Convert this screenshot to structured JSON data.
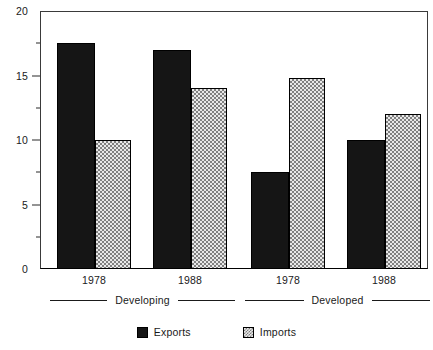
{
  "chart_data": {
    "type": "bar",
    "title": "",
    "subtitle": "",
    "xlabel": "",
    "ylabel": "",
    "ylim": [
      0,
      20
    ],
    "y_major_ticks": [
      0,
      5,
      10,
      15,
      20
    ],
    "y_major_tick_labels": [
      "0",
      "5",
      "10",
      "15",
      "20"
    ],
    "y_minor_ticks": [
      2.5,
      7.5,
      12.5,
      17.5
    ],
    "grid": false,
    "legend_position": "bottom-center",
    "groups": [
      {
        "group": "Developing",
        "year": "1978"
      },
      {
        "group": "Developing",
        "year": "1988"
      },
      {
        "group": "Developed",
        "year": "1978"
      },
      {
        "group": "Developed",
        "year": "1988"
      }
    ],
    "categories": [
      "1978",
      "1988",
      "1978",
      "1988"
    ],
    "group_brackets": [
      {
        "label": "Developing",
        "categories": [
          "1978",
          "1988"
        ]
      },
      {
        "label": "Developed",
        "categories": [
          "1978",
          "1988"
        ]
      }
    ],
    "series": [
      {
        "name": "Exports",
        "fill": "solid-black",
        "color": "#151515",
        "values": [
          17.5,
          17.0,
          7.5,
          10.0
        ]
      },
      {
        "name": "Imports",
        "fill": "checkerboard-gray",
        "color": "#c0c0c0",
        "values": [
          10.0,
          14.0,
          14.8,
          12.0
        ]
      }
    ],
    "bars": [
      {
        "group": "Developing",
        "year": "1978",
        "series": "Exports",
        "value": 17.5
      },
      {
        "group": "Developing",
        "year": "1978",
        "series": "Imports",
        "value": 10.0
      },
      {
        "group": "Developing",
        "year": "1988",
        "series": "Exports",
        "value": 17.0
      },
      {
        "group": "Developing",
        "year": "1988",
        "series": "Imports",
        "value": 14.0
      },
      {
        "group": "Developed",
        "year": "1978",
        "series": "Exports",
        "value": 7.5
      },
      {
        "group": "Developed",
        "year": "1978",
        "series": "Imports",
        "value": 14.8
      },
      {
        "group": "Developed",
        "year": "1988",
        "series": "Exports",
        "value": 10.0
      },
      {
        "group": "Developed",
        "year": "1988",
        "series": "Imports",
        "value": 12.0
      }
    ],
    "legend": [
      {
        "label": "Exports",
        "swatch": "solid-black"
      },
      {
        "label": "Imports",
        "swatch": "checkerboard-gray"
      }
    ]
  },
  "axis": {
    "y_labels": [
      "20",
      "15",
      "10",
      "5",
      "0"
    ]
  },
  "x_axis": {
    "year_labels": [
      "1978",
      "1988",
      "1978",
      "1988"
    ]
  },
  "brackets": {
    "labels": [
      "Developing",
      "Developed"
    ]
  },
  "legend": {
    "exports_label": "Exports",
    "imports_label": "Imports"
  },
  "colors": {
    "exports": "#151515",
    "imports": "#c8c8c8",
    "axis": "#1a1a1a",
    "background": "#ffffff"
  }
}
